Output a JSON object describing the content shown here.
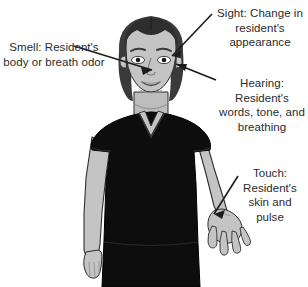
{
  "figure": {
    "background_color": "#ffffff",
    "text_color": "#2b2b2b",
    "skin_color": "#c4c4c4",
    "hair_color": "#3a3a3a",
    "uniform_color": "#0d0d0d",
    "line_color": "#1c1c1c"
  },
  "subject": {
    "alt": "caregiver in dark scrub top standing with right hand open"
  },
  "callouts": {
    "sight": "Sight: Change in resident's appearance",
    "smell": "Smell: Resident's body or breath odor",
    "hearing": "Hearing: Resident's words, tone, and breathing",
    "touch": "Touch: Resident's skin and pulse"
  }
}
